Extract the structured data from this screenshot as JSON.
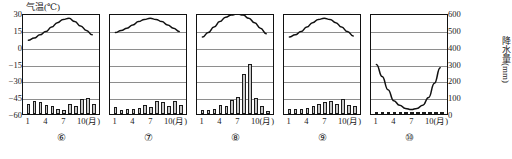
{
  "axes": {
    "left_title": "气温(℃)",
    "right_title": "降水量(mm)",
    "temp_ticks": [
      "30",
      "15",
      "0",
      "-15",
      "-30",
      "-45",
      "-60"
    ],
    "precip_ticks": [
      "600",
      "500",
      "400",
      "300",
      "200",
      "100",
      "0"
    ],
    "month_ticks": [
      "1",
      "4",
      "7",
      "10"
    ],
    "month_unit": "(月)"
  },
  "chart_data": [
    {
      "type": "line",
      "title": "⑥",
      "xlabel": "月",
      "ylabel": "气温(℃)",
      "y2label": "降水量(mm)",
      "ylim": [
        -60,
        30
      ],
      "y2lim": [
        0,
        600
      ],
      "grid": true,
      "categories": [
        "1",
        "2",
        "3",
        "4",
        "5",
        "6",
        "7",
        "8",
        "9",
        "10",
        "11",
        "12"
      ],
      "series": [
        {
          "name": "气温",
          "type": "line",
          "axis": "left",
          "values": [
            7,
            9,
            12,
            15,
            19,
            23,
            26,
            27,
            24,
            20,
            16,
            12
          ]
        },
        {
          "name": "降水量",
          "type": "bar",
          "axis": "right",
          "values": [
            58,
            75,
            72,
            52,
            48,
            28,
            22,
            60,
            50,
            92,
            95,
            62
          ]
        }
      ]
    },
    {
      "type": "line",
      "title": "⑦",
      "xlabel": "月",
      "ylabel": "气温(℃)",
      "y2label": "降水量(mm)",
      "ylim": [
        -60,
        30
      ],
      "y2lim": [
        0,
        600
      ],
      "grid": true,
      "categories": [
        "1",
        "2",
        "3",
        "4",
        "5",
        "6",
        "7",
        "8",
        "9",
        "10",
        "11",
        "12"
      ],
      "series": [
        {
          "name": "气温",
          "type": "line",
          "axis": "left",
          "values": [
            14,
            16,
            18,
            21,
            24,
            26,
            27,
            26,
            24,
            21,
            18,
            15
          ]
        },
        {
          "name": "降水量",
          "type": "bar",
          "axis": "right",
          "values": [
            42,
            25,
            30,
            32,
            38,
            55,
            40,
            78,
            72,
            48,
            75,
            55
          ]
        }
      ]
    },
    {
      "type": "line",
      "title": "⑧",
      "xlabel": "月",
      "ylabel": "气温(℃)",
      "y2label": "降水量(mm)",
      "ylim": [
        -60,
        30
      ],
      "y2lim": [
        0,
        600
      ],
      "grid": true,
      "categories": [
        "1",
        "2",
        "3",
        "4",
        "5",
        "6",
        "7",
        "8",
        "9",
        "10",
        "11",
        "12"
      ],
      "series": [
        {
          "name": "气温",
          "type": "line",
          "axis": "left",
          "values": [
            10,
            14,
            19,
            24,
            28,
            30,
            31,
            30,
            27,
            23,
            18,
            13
          ]
        },
        {
          "name": "降水量",
          "type": "bar",
          "axis": "right",
          "values": [
            22,
            25,
            30,
            55,
            48,
            85,
            100,
            235,
            300,
            95,
            45,
            18
          ]
        }
      ]
    },
    {
      "type": "line",
      "title": "⑨",
      "xlabel": "月",
      "ylabel": "气温(℃)",
      "y2label": "降水量(mm)",
      "ylim": [
        -60,
        30
      ],
      "y2lim": [
        0,
        600
      ],
      "grid": true,
      "categories": [
        "1",
        "2",
        "3",
        "4",
        "5",
        "6",
        "7",
        "8",
        "9",
        "10",
        "11",
        "12"
      ],
      "series": [
        {
          "name": "气温",
          "type": "line",
          "axis": "left",
          "values": [
            10,
            12,
            15,
            19,
            23,
            26,
            27,
            26,
            23,
            19,
            15,
            11
          ]
        },
        {
          "name": "降水量",
          "type": "bar",
          "axis": "right",
          "values": [
            30,
            28,
            32,
            35,
            48,
            62,
            72,
            80,
            62,
            88,
            52,
            45
          ]
        }
      ]
    },
    {
      "type": "line",
      "title": "⑩",
      "xlabel": "月",
      "ylabel": "气温(℃)",
      "y2label": "降水量(mm)",
      "ylim": [
        -60,
        30
      ],
      "y2lim": [
        0,
        600
      ],
      "grid": true,
      "categories": [
        "1",
        "2",
        "3",
        "4",
        "5",
        "6",
        "7",
        "8",
        "9",
        "10",
        "11",
        "12"
      ],
      "series": [
        {
          "name": "气温",
          "type": "line",
          "axis": "left",
          "values": [
            -15,
            -26,
            -38,
            -48,
            -52,
            -55,
            -56,
            -55,
            -52,
            -45,
            -32,
            -18
          ]
        },
        {
          "name": "降水量",
          "type": "bar",
          "axis": "right",
          "values": [
            8,
            8,
            10,
            10,
            10,
            10,
            10,
            10,
            10,
            10,
            8,
            8
          ]
        }
      ]
    }
  ]
}
